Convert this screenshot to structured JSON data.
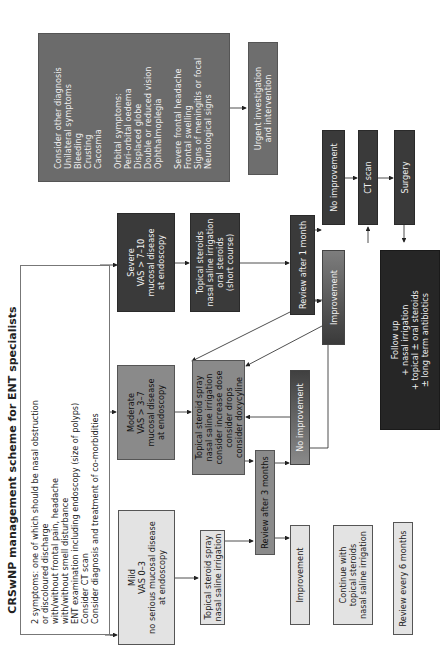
{
  "title": "CRSwNP management scheme for ENT specialists",
  "entry": {
    "lines": [
      "2 symptoms: one of which should be nasal obstruction",
      "or discoloured discharge",
      "with/without frontal pain, headache",
      "with/without smell disturbance",
      "ENT examination including endoscopy (size of polyps)",
      "Consider CT scan",
      "Consider diagnosis and treatment of co-morbidities"
    ]
  },
  "severity": {
    "mild": {
      "lines": [
        "Mild",
        "VAS 0–3",
        "no serious mucosal disease",
        "at endoscopy"
      ]
    },
    "moderate": {
      "lines": [
        "Moderate",
        "VAS > 3–7",
        "mucosal disease",
        "at endoscopy"
      ]
    },
    "severe": {
      "lines": [
        "Severe",
        "VAS > 7–10",
        "mucosal disease",
        "at endoscopy"
      ]
    }
  },
  "red_flags": {
    "group1": [
      "Consider other diagnosis",
      "Unilateral symptoms",
      "Bleeding",
      "Crusting",
      "Cacosmia"
    ],
    "group2": [
      "Orbital symptoms:",
      "Peri-orbital oedema",
      "Displaced globe",
      "Double or reduced vision",
      "Ophthalmoplegia"
    ],
    "group3": [
      "Severe frontal headache",
      "Frontal swelling",
      "Signs of meningitis or focal",
      "Neurological signs"
    ]
  },
  "urgent": {
    "lines": [
      "Urgent investigation",
      "and intervention"
    ]
  },
  "treatment": {
    "mild": {
      "lines": [
        "Topical steroid spray",
        "nasal saline irrigation"
      ]
    },
    "moderate": {
      "lines": [
        "Topical steroid spray",
        "nasal saline irrigation",
        "consider increase dose",
        "consider drops",
        "consider doxycyline"
      ]
    },
    "severe": {
      "lines": [
        "Topical steroids",
        "nasal saline irrigation",
        "oral steroids",
        "(short course)"
      ]
    }
  },
  "review": {
    "three_months": "Review after 3 months",
    "one_month": "Review after 1 month",
    "six_months": "Review every 6 months"
  },
  "outcomes": {
    "mild_improvement": "Improvement",
    "mild_no_improvement": "No improvement",
    "severe_improvement": "Improvement",
    "severe_no_improvement": "No improvement"
  },
  "ct_scan": "CT scan",
  "surgery": "Surgery",
  "follow_up": {
    "lines": [
      "Follow up",
      "+ nasal irrigation",
      "+ topical ± oral steroids",
      "± long term antibiotics"
    ]
  },
  "continue": {
    "lines": [
      "Continue with",
      "topical steroids",
      "nasal saline irrigation"
    ]
  },
  "colors": {
    "light_box": "#e3e3e3",
    "moderate_box": "#8a8a8a",
    "severe_box": "#3a3a3a",
    "red_flag_box": "#6b6b6b",
    "follow_up_box": "#262626",
    "connector": "#222222"
  }
}
